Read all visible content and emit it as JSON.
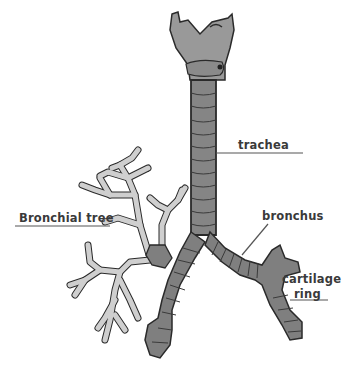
{
  "diagram": {
    "title": "",
    "type": "anatomical-illustration",
    "labels": [
      {
        "id": "trachea",
        "text": "trachea"
      },
      {
        "id": "bronchial-tree",
        "text": "Bronchial tree"
      },
      {
        "id": "bronchus",
        "text": "bronchus"
      },
      {
        "id": "cartilage",
        "text": "cartilage"
      },
      {
        "id": "ring",
        "text": "ring"
      }
    ],
    "colors": {
      "cartilage_dark": "#7f7f7f",
      "cartilage_mid": "#8e8e8e",
      "larynx": "#999999",
      "bronchial_tree": "#cfcfcf",
      "outline": "#2a2a2a",
      "leader_line": "#555555",
      "label_text": "#3a3a3a"
    }
  }
}
